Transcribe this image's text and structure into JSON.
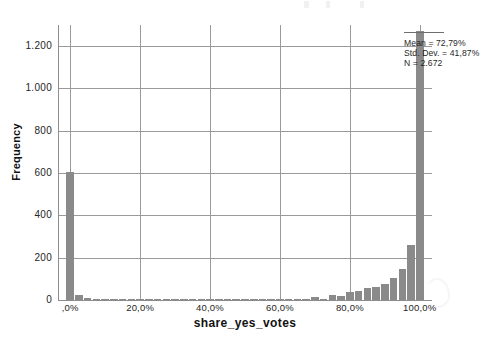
{
  "chart_data": {
    "type": "bar",
    "title": "",
    "subtitle": "",
    "xlabel": "share_yes_votes",
    "ylabel": "Frequency",
    "grid": true,
    "legend": "none",
    "xlim": [
      -3.5,
      103.5
    ],
    "ylim": [
      0,
      1300
    ],
    "x_tick_labels": [
      ",0%",
      "20,0%",
      "40,0%",
      "60,0%",
      "80,0%",
      "100,0%"
    ],
    "x_tick_values": [
      0,
      20,
      40,
      60,
      80,
      100
    ],
    "y_tick_labels": [
      "0",
      "200",
      "400",
      "600",
      "800",
      "1.000",
      "1.200"
    ],
    "y_tick_values": [
      0,
      200,
      400,
      600,
      800,
      1000,
      1200
    ],
    "bin_width": 2.5,
    "categories": [
      "0,0%",
      "2,5%",
      "5,0%",
      "7,5%",
      "10,0%",
      "12,5%",
      "15,0%",
      "17,5%",
      "20,0%",
      "22,5%",
      "25,0%",
      "27,5%",
      "30,0%",
      "32,5%",
      "35,0%",
      "37,5%",
      "40,0%",
      "42,5%",
      "45,0%",
      "47,5%",
      "50,0%",
      "52,5%",
      "55,0%",
      "57,5%",
      "60,0%",
      "62,5%",
      "65,0%",
      "67,5%",
      "70,0%",
      "72,5%",
      "75,0%",
      "77,5%",
      "80,0%",
      "82,5%",
      "85,0%",
      "87,5%",
      "90,0%",
      "92,5%",
      "95,0%",
      "97,5%",
      "100,0%"
    ],
    "x": [
      0,
      2.5,
      5,
      7.5,
      10,
      12.5,
      15,
      17.5,
      20,
      22.5,
      25,
      27.5,
      30,
      32.5,
      35,
      37.5,
      40,
      42.5,
      45,
      47.5,
      50,
      52.5,
      55,
      57.5,
      60,
      62.5,
      65,
      67.5,
      70,
      72.5,
      75,
      77.5,
      80,
      82.5,
      85,
      87.5,
      90,
      92.5,
      95,
      97.5,
      100
    ],
    "values": [
      605,
      22,
      8,
      3,
      2,
      3,
      2,
      2,
      6,
      2,
      2,
      2,
      2,
      2,
      3,
      2,
      5,
      2,
      2,
      2,
      3,
      2,
      2,
      3,
      6,
      3,
      4,
      4,
      14,
      6,
      22,
      18,
      36,
      42,
      55,
      62,
      78,
      104,
      148,
      258,
      1272
    ],
    "statistics": {
      "mean_label": "Mean = 72,79%",
      "std_dev_label": "Std. Dev. = 41,87%",
      "n_label": "N = 2.672",
      "mean": 72.79,
      "std_dev": 41.87,
      "n": 2672
    },
    "colors": {
      "bar": "#8a8a8a",
      "axis": "#8d8d8d",
      "grid": "#9a9a9a",
      "text": "#1c1c1c",
      "background": "#ffffff"
    }
  }
}
